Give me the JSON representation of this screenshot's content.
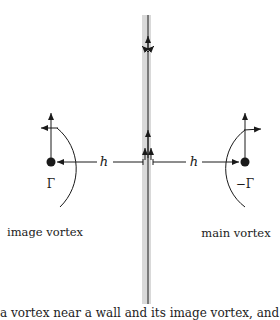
{
  "diagram": {
    "labels": {
      "left_distance": "h",
      "right_distance": "h",
      "left_strength": "Γ",
      "right_strength": "−Γ",
      "left_name": "image vortex",
      "right_name": "main vortex"
    },
    "caption": "a vortex near a wall and its image vortex, and the induced velocities"
  },
  "colors": {
    "line": "#1a1a1a",
    "wall": "#d9d9d9"
  }
}
